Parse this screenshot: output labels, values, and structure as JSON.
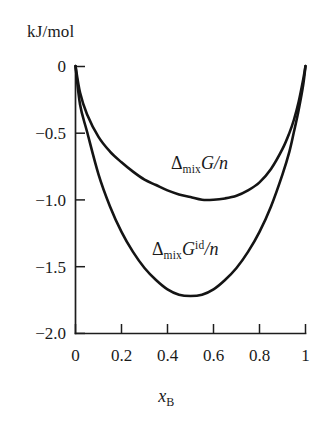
{
  "figure": {
    "unit_label": "kJ/mol",
    "background_color": "#ffffff",
    "curve_color": "#141414",
    "axis_color": "#1d1d1d"
  },
  "xaxis": {
    "title_symbol": "x",
    "title_subscript": "B",
    "tick_labels": [
      "0",
      "0.2",
      "0.4",
      "0.6",
      "0.8",
      "1"
    ]
  },
  "yaxis": {
    "tick_labels": [
      "0",
      "−0.5",
      "−1.0",
      "−1.5",
      "−2.0"
    ]
  },
  "annotations": {
    "real": {
      "delta": "Δ",
      "subscript": "mix",
      "symbol": "G",
      "per": "/",
      "n": "n"
    },
    "ideal": {
      "delta": "Δ",
      "subscript": "mix",
      "symbol": "G",
      "superscript": "id",
      "per": "/",
      "n": "n"
    }
  },
  "chart_data": {
    "type": "line",
    "title": "",
    "subtitle": "",
    "xlabel": "x_B",
    "ylabel": "kJ/mol",
    "xlim": [
      0,
      1
    ],
    "ylim": [
      -2.0,
      0
    ],
    "grid": false,
    "legend": "inline-annotations",
    "xticks": [
      0,
      0.2,
      0.4,
      0.6,
      0.8,
      1
    ],
    "yticks": [
      0,
      -0.5,
      -1.0,
      -1.5,
      -2.0
    ],
    "x": [
      0,
      0.02,
      0.05,
      0.1,
      0.15,
      0.2,
      0.25,
      0.3,
      0.35,
      0.4,
      0.45,
      0.5,
      0.55,
      0.6,
      0.65,
      0.7,
      0.75,
      0.8,
      0.85,
      0.9,
      0.93,
      0.95,
      0.97,
      0.99,
      1
    ],
    "series": [
      {
        "name": "ΔmixG/n",
        "label": "Δ_mix G / n",
        "description": "real (non-ideal) solution, minimum near x_B = 0.56",
        "minimum": {
          "x": 0.56,
          "y": -1.0
        },
        "values": [
          0.0,
          -0.2,
          -0.36,
          -0.53,
          -0.64,
          -0.72,
          -0.79,
          -0.85,
          -0.89,
          -0.93,
          -0.96,
          -0.98,
          -1.0,
          -1.0,
          -0.99,
          -0.97,
          -0.93,
          -0.87,
          -0.77,
          -0.62,
          -0.5,
          -0.4,
          -0.27,
          -0.1,
          0.0
        ]
      },
      {
        "name": "ΔmixG^id/n",
        "label": "Δ_mix G^id / n",
        "description": "ideal solution, RT[x lnx + (1-x)ln(1-x)] with RT ≈ 2.48 kJ/mol, symmetric minimum at x_B = 0.5",
        "minimum": {
          "x": 0.5,
          "y": -1.72
        },
        "values": [
          0.0,
          -0.29,
          -0.49,
          -0.81,
          -1.05,
          -1.24,
          -1.39,
          -1.51,
          -1.6,
          -1.67,
          -1.71,
          -1.72,
          -1.71,
          -1.67,
          -1.6,
          -1.51,
          -1.39,
          -1.24,
          -1.05,
          -0.81,
          -0.64,
          -0.49,
          -0.33,
          -0.14,
          0.0
        ]
      }
    ]
  }
}
